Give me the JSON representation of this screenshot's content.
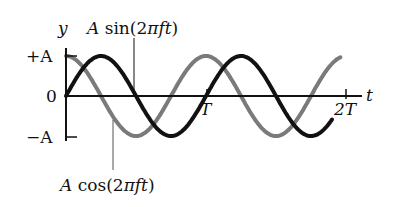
{
  "chart_data": {
    "type": "line",
    "title": "",
    "xlabel": "t",
    "ylabel": "y",
    "x_ticks": [
      "T",
      "2T"
    ],
    "y_ticks": [
      "+A",
      "0",
      "−A"
    ],
    "series": [
      {
        "name": "A sin(2πft)",
        "color": "#111111",
        "phase": "sin",
        "x_range_periods": [
          0,
          1.9
        ]
      },
      {
        "name": "A cos(2πft)",
        "color": "#7a7a7a",
        "phase": "cos",
        "x_range_periods": [
          0,
          1.96
        ]
      }
    ],
    "ylim": [
      "-A",
      "+A"
    ],
    "xlim": [
      0,
      "2T"
    ]
  },
  "labels": {
    "y_axis": "y",
    "t_axis": "t",
    "plus_a": "+A",
    "zero": "0",
    "minus_a": "−A",
    "tick_T": "T",
    "tick_2T": "2T",
    "sin_label_A": "A",
    "sin_label_fn": " sin(2",
    "sin_label_pi": "π",
    "sin_label_ft": "ft",
    "sin_label_close": ")",
    "cos_label_A": "A",
    "cos_label_fn": " cos(2",
    "cos_label_pi": "π",
    "cos_label_ft": "ft",
    "cos_label_close": ")"
  },
  "colors": {
    "sin": "#111111",
    "cos": "#7a7a7a",
    "axis": "#111111"
  }
}
